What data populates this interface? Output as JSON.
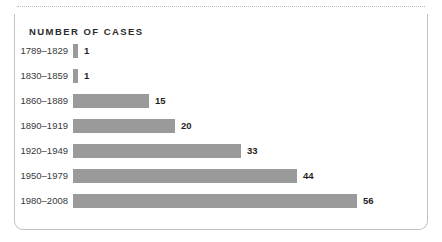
{
  "card": {
    "title": "NUMBER OF CASES"
  },
  "chart_data": {
    "type": "bar",
    "orientation": "horizontal",
    "title": "NUMBER OF CASES",
    "xlabel": "",
    "ylabel": "",
    "grid": false,
    "legend": false,
    "bar_color": "#9a9a9a",
    "value_label_color": "#1f1f1f",
    "categories": [
      "1789–1829",
      "1830–1859",
      "1860–1889",
      "1890–1919",
      "1920–1949",
      "1950–1979",
      "1980–2008"
    ],
    "values": [
      1,
      1,
      15,
      20,
      33,
      44,
      56
    ],
    "value_labels": [
      "1",
      "1",
      "15",
      "20",
      "33",
      "44",
      "56"
    ],
    "xlim": [
      0,
      56
    ],
    "px_per_unit": 5.08
  }
}
